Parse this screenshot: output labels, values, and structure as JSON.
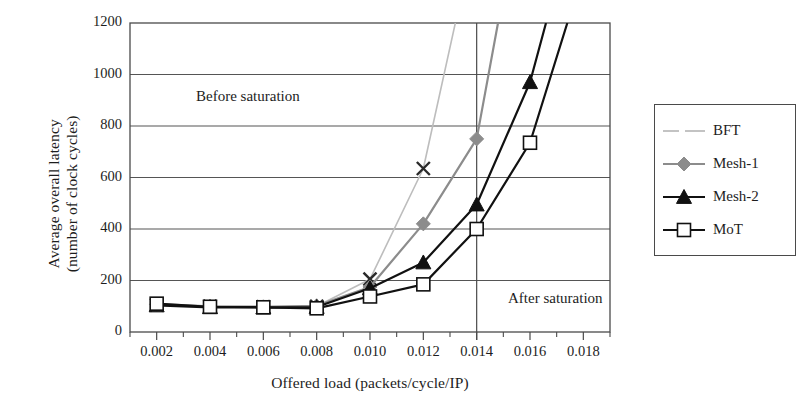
{
  "chart_data": {
    "type": "line",
    "title": "",
    "xlabel": "Offered load (packets/cycle/IP)",
    "ylabel_line1": "Average overall latency",
    "ylabel_line2": "(number of clock cycles)",
    "xlim": [
      0.001,
      0.019
    ],
    "ylim": [
      0,
      1200
    ],
    "xticks": [
      "0.002",
      "0.004",
      "0.006",
      "0.008",
      "0.010",
      "0.012",
      "0.014",
      "0.016",
      "0.018"
    ],
    "xtick_values": [
      0.002,
      0.004,
      0.006,
      0.008,
      0.01,
      0.012,
      0.014,
      0.016,
      0.018
    ],
    "yticks": [
      "0",
      "200",
      "400",
      "600",
      "800",
      "1000",
      "1200"
    ],
    "ytick_values": [
      0,
      200,
      400,
      600,
      800,
      1000,
      1200
    ],
    "grid": "horizontal",
    "legend_position": "right-outside",
    "annotations": [
      {
        "text": "Before saturation",
        "x": 0.0055,
        "y": 900
      },
      {
        "text": "After saturation",
        "x": 0.0143,
        "y": 120
      }
    ],
    "saturation_line_x": 0.014,
    "series": [
      {
        "name": "BFT",
        "color": "#bdbdbd",
        "marker": "x",
        "marker_color": "#2a2a2a",
        "x": [
          0.002,
          0.004,
          0.006,
          0.008,
          0.01,
          0.012,
          0.0132
        ],
        "values": [
          105,
          100,
          98,
          100,
          205,
          635,
          1200
        ]
      },
      {
        "name": "Mesh-1",
        "color": "#8c8c8c",
        "marker": "diamond",
        "marker_color": "#8c8c8c",
        "x": [
          0.002,
          0.004,
          0.006,
          0.008,
          0.01,
          0.012,
          0.014,
          0.0148
        ],
        "values": [
          108,
          100,
          98,
          102,
          175,
          420,
          750,
          1200
        ]
      },
      {
        "name": "Mesh-2",
        "color": "#111111",
        "marker": "triangle",
        "marker_color": "#111111",
        "x": [
          0.002,
          0.004,
          0.006,
          0.008,
          0.01,
          0.012,
          0.014,
          0.016,
          0.0166
        ],
        "values": [
          103,
          96,
          95,
          97,
          170,
          270,
          495,
          970,
          1200
        ]
      },
      {
        "name": "MoT",
        "color": "#111111",
        "marker": "square-open",
        "marker_color": "#111111",
        "x": [
          0.002,
          0.004,
          0.006,
          0.008,
          0.01,
          0.012,
          0.014,
          0.016,
          0.0174
        ],
        "values": [
          110,
          98,
          96,
          92,
          138,
          185,
          400,
          735,
          1200
        ]
      }
    ]
  },
  "legend": {
    "items": [
      {
        "label": "BFT"
      },
      {
        "label": "Mesh-1"
      },
      {
        "label": "Mesh-2"
      },
      {
        "label": "MoT"
      }
    ]
  }
}
